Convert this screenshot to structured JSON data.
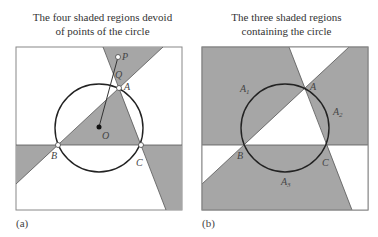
{
  "panels": [
    {
      "id": "a",
      "title_line1": "The four shaded regions devoid",
      "title_line2": "of points of the circle",
      "tag": "(a)",
      "points": {
        "P": "P",
        "Q": "Q",
        "A": "A",
        "B": "B",
        "C": "C",
        "O": "O"
      }
    },
    {
      "id": "b",
      "title_line1": "The three shaded regions",
      "title_line2": "containing the circle",
      "tag": "(b)",
      "points": {
        "A": "A",
        "B": "B",
        "C": "C"
      },
      "regions": {
        "A1": "A",
        "A1_sub": "1",
        "A2": "A",
        "A2_sub": "2",
        "A3": "A",
        "A3_sub": "3"
      }
    }
  ],
  "colors": {
    "shade": "#a6a6a6",
    "stroke": "#222222",
    "frame": "#888888"
  }
}
